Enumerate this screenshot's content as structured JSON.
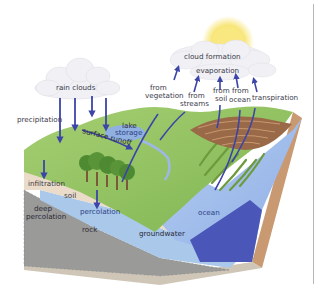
{
  "diagram": {
    "colors": {
      "arrow": "#3c44a8",
      "grass": "#8cc063",
      "soil": "#eadcc8",
      "groundwater": "#a9c8ea",
      "ocean": "#9fbbe8",
      "ocean_side": "#4a56b8",
      "rock": "#9a9a98",
      "earth_side": "#c99a72",
      "sun": "#f7e36b",
      "cloud": "#f2f2f6"
    },
    "labels": {
      "rain_clouds": "rain clouds",
      "precipitation": "precipitation",
      "lake_storage_line1": "lake",
      "lake_storage_line2": "storage",
      "surface_runoff": "surface runoff",
      "infiltration": "infiltration",
      "soil": "soil",
      "deep_percolation_line1": "deep",
      "deep_percolation_line2": "percolation",
      "percolation": "percolation",
      "rock": "rock",
      "groundwater": "groundwater",
      "ocean": "ocean",
      "cloud_formation": "cloud formation",
      "evaporation": "evaporation",
      "from_vegetation_line1": "from",
      "from_vegetation_line2": "vegetation",
      "from_streams_line1": "from",
      "from_streams_line2": "streams",
      "from_soil_line1": "from",
      "from_soil_line2": "soil",
      "from_ocean_line1": "from",
      "from_ocean_line2": "ocean",
      "transpiration": "transpiration"
    }
  }
}
